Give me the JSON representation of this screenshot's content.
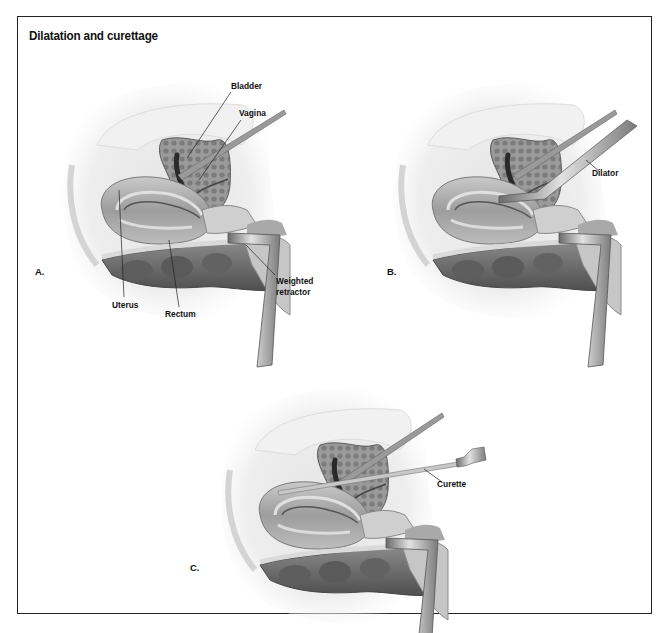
{
  "title": "Dilatation and curettage",
  "panels": [
    {
      "id": "A",
      "label": "A.",
      "callouts": {
        "bladder": "Bladder",
        "vagina": "Vagina",
        "uterus": "Uterus",
        "rectum": "Rectum",
        "retractor_line1": "Weighted",
        "retractor_line2": "retractor"
      }
    },
    {
      "id": "B",
      "label": "B.",
      "callouts": {
        "dilator": "Dilator"
      }
    },
    {
      "id": "C",
      "label": "C.",
      "callouts": {
        "curette": "Curette"
      }
    }
  ],
  "colors": {
    "border": "#222222",
    "tissue_light": "#e6e6e6",
    "tissue_mid": "#b9b9b9",
    "tissue_dark": "#6e6e6e",
    "instrument": "#8a8a8a"
  }
}
